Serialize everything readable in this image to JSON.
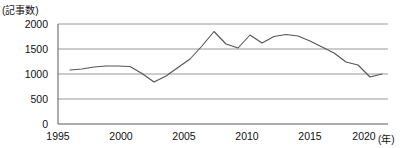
{
  "chart_data": {
    "type": "line",
    "title": "",
    "subtitle": "",
    "ylabel": "(記事数)",
    "xlabel": "(年)",
    "ylim": [
      0,
      2000
    ],
    "xlim": [
      1994,
      2021.5
    ],
    "yticks": [
      0,
      500,
      1000,
      1500,
      2000
    ],
    "ytick_labels": [
      "0",
      "500",
      "1000",
      "1500",
      "2000"
    ],
    "xticks": [
      1995,
      2000,
      2005,
      2010,
      2015,
      2020
    ],
    "xtick_labels": [
      "1995",
      "2000",
      "2005",
      "2010",
      "2015",
      "2020"
    ],
    "grid": true,
    "grid_axis": "y",
    "legend": "none",
    "line_color": "#555555",
    "grid_color": "#999999",
    "axis_color": "#555555",
    "series": [
      {
        "name": "記事数",
        "x": [
          1995,
          1996,
          1997,
          1998,
          1999,
          2000,
          2001,
          2002,
          2003,
          2004,
          2005,
          2006,
          2007,
          2008,
          2009,
          2010,
          2011,
          2012,
          2013,
          2014,
          2015,
          2016,
          2017,
          2018,
          2019,
          2020,
          2021
        ],
        "values": [
          1080,
          1100,
          1140,
          1160,
          1160,
          1150,
          1010,
          840,
          960,
          1130,
          1300,
          1560,
          1850,
          1600,
          1520,
          1780,
          1620,
          1750,
          1790,
          1760,
          1660,
          1540,
          1420,
          1240,
          1180,
          940,
          1000
        ]
      }
    ],
    "annotations": []
  },
  "axis": {
    "y_unit_caption": "(記事数)",
    "x_unit_caption": "(年)"
  }
}
